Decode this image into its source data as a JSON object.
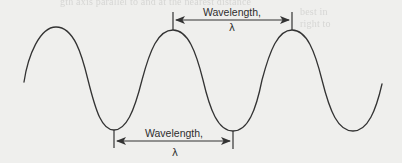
{
  "figure": {
    "type": "sine-wave-wavelength-diagram",
    "background_color": "#efefed",
    "stroke_color": "#333333",
    "wave": {
      "start": [
        24,
        82
      ],
      "peaks": [
        [
          56,
          27
        ],
        [
          173,
          30
        ],
        [
          292,
          30
        ]
      ],
      "troughs": [
        [
          114,
          130
        ],
        [
          233,
          131
        ],
        [
          353,
          131
        ]
      ],
      "end": [
        382,
        84
      ]
    },
    "top_annotation": {
      "label": "Wavelength,",
      "symbol": "λ",
      "from_x": 173,
      "to_x": 292,
      "arrow_y": 20,
      "measures": "peak-to-peak"
    },
    "bottom_annotation": {
      "label": "Wavelength,",
      "symbol": "λ",
      "from_x": 114,
      "to_x": 233,
      "arrow_y": 141,
      "measures": "trough-to-trough"
    }
  }
}
